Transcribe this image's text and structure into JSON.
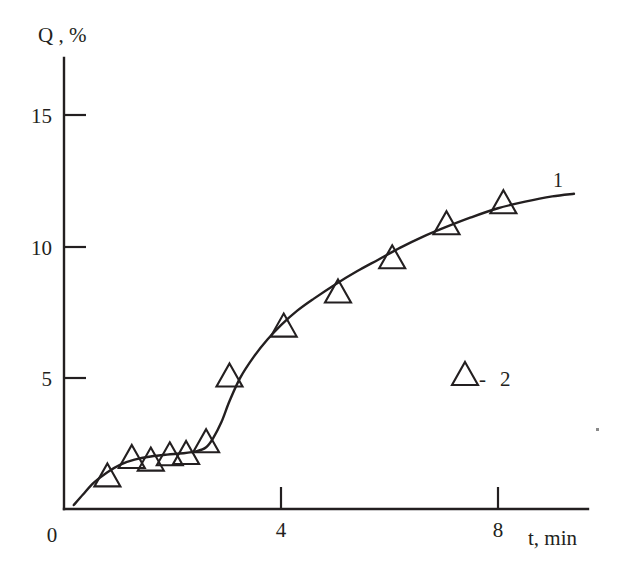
{
  "chart_data": {
    "type": "scatter",
    "title": "",
    "xlabel": "t, min",
    "ylabel": "Q , %",
    "xlim": [
      0,
      10.3
    ],
    "ylim": [
      0,
      17.0
    ],
    "grid": false,
    "x_ticks": [
      "0",
      "4",
      "8"
    ],
    "x_tick_values": [
      0,
      4,
      8
    ],
    "y_ticks": [
      "5",
      "10",
      "15"
    ],
    "y_tick_values": [
      5,
      10,
      15
    ],
    "origin_label": "0",
    "series": [
      {
        "name": "1",
        "label": "1",
        "type": "line",
        "marker": "none",
        "x": [
          0.18,
          0.35,
          0.55,
          0.8,
          1.05,
          1.3,
          1.6,
          1.9,
          2.2,
          2.45,
          2.62,
          2.75,
          2.9,
          3.05,
          3.25,
          3.5,
          3.75,
          4.0,
          4.3,
          4.6,
          5.0,
          5.4,
          5.8,
          6.2,
          6.6,
          7.0,
          7.5,
          8.0,
          8.5,
          9.0,
          9.4
        ],
        "y": [
          0.15,
          0.55,
          1.0,
          1.4,
          1.7,
          1.88,
          2.0,
          2.07,
          2.12,
          2.2,
          2.35,
          2.7,
          3.3,
          4.1,
          5.0,
          5.8,
          6.45,
          7.0,
          7.55,
          8.0,
          8.55,
          9.05,
          9.5,
          9.95,
          10.35,
          10.7,
          11.1,
          11.45,
          11.7,
          11.9,
          12.0
        ]
      },
      {
        "name": "2",
        "label": "2",
        "type": "scatter",
        "marker": "open-triangle",
        "x": [
          0.8,
          1.25,
          1.6,
          1.95,
          2.25,
          2.62,
          3.05,
          4.05,
          5.05,
          6.05,
          7.05,
          8.1
        ],
        "y": [
          1.3,
          2.0,
          1.9,
          2.1,
          2.15,
          2.6,
          5.1,
          7.0,
          8.3,
          9.6,
          10.9,
          11.7
        ]
      }
    ],
    "annotations": [
      {
        "text": "1",
        "x": 9.05,
        "y": 12.55,
        "name": "curve-label-1"
      }
    ],
    "legend": {
      "position": "inside-right",
      "entries": [
        {
          "marker": "open-triangle",
          "separator": "-",
          "label": "2"
        }
      ]
    }
  },
  "axes": {
    "y_axis_title": "Q , %",
    "x_axis_title": "t, min"
  },
  "legend_entry_label": "2",
  "legend_separator": "-",
  "curve_one_label": "1",
  "colors": {
    "ink": "#231f20",
    "background": "#ffffff"
  }
}
